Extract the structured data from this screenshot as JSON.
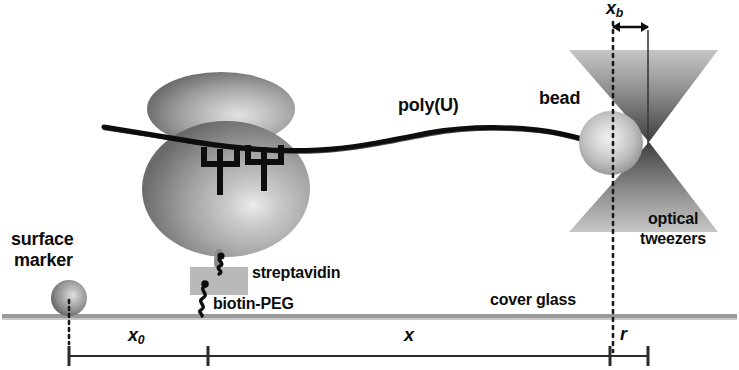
{
  "figure": {
    "type": "schematic-diagram",
    "background_color": "#ffffff",
    "ink_color": "#0d0d0d"
  },
  "labels": {
    "poly_u": "poly(U)",
    "bead": "bead",
    "surface_marker_line1": "surface",
    "surface_marker_line2": "marker",
    "streptavidin": "streptavidin",
    "biotin_peg": "biotin-PEG",
    "cover_glass": "cover glass",
    "optical_line1": "optical",
    "optical_line2": "tweezers"
  },
  "measurements": {
    "x_b": {
      "symbol": "x",
      "subscript": "b",
      "location": "top",
      "description": "bead displacement from trap center"
    },
    "x_0": {
      "symbol": "x",
      "subscript": "0",
      "location": "bottom-left",
      "description": "distance from surface marker to ribosome anchor"
    },
    "x": {
      "symbol": "x",
      "subscript": "",
      "location": "bottom-middle",
      "description": "tether extension"
    },
    "r": {
      "symbol": "r",
      "subscript": "",
      "location": "bottom-right",
      "description": "bead radius"
    }
  },
  "colors": {
    "ribosome_light": "#d8d8d8",
    "ribosome_mid": "#a8a8a8",
    "ribosome_dark": "#6e6e6e",
    "bead_light": "#e6e6e6",
    "bead_mid": "#b4b4b4",
    "bead_dark": "#8a8a8a",
    "marker_light": "#d0d0d0",
    "marker_dark": "#6a6a6a",
    "cone_light": "#bdbdbd",
    "cone_dark": "#4a4a4a",
    "streptavidin_fill": "#b9b9b9",
    "cover_glass": "#9a9a9a",
    "ink": "#0d0d0d"
  },
  "elements": {
    "ribosome": {
      "name": "ribosome",
      "lobes": 2,
      "tRNA_count": 2,
      "tRNA_glyph": "psi-shape"
    },
    "rna_strand": {
      "name": "poly(U) mRNA strand",
      "style": "rough-hand-drawn-line"
    },
    "trap": {
      "name": "optical trap",
      "shape": "double-cone-hourglass"
    },
    "linkers": {
      "name": "biotin-PEG zigzag linker",
      "count": 2,
      "style": "zigzag"
    }
  }
}
